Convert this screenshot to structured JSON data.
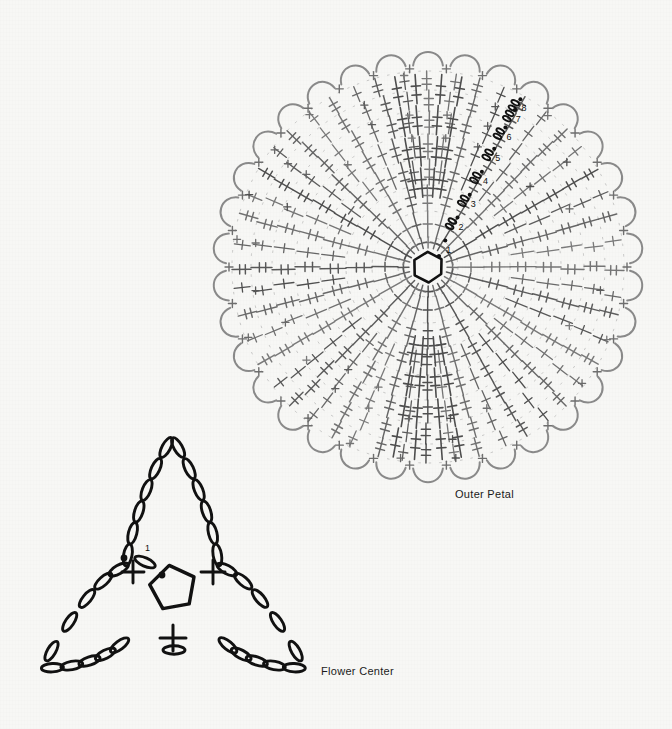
{
  "page": {
    "background_color": "#f7f7f5",
    "ink_dark": "#111111",
    "ink_gray": "#6e6e6e",
    "ink_mid": "#4a4a4a"
  },
  "diagram": {
    "type": "crochet-stitch-chart",
    "motifs": [
      {
        "id": "outer-petal",
        "caption": "Outer Petal",
        "caption_position": {
          "x": 455,
          "y": 488
        },
        "center": {
          "x": 428,
          "y": 267
        },
        "start": "magic-ring",
        "rounds": 8,
        "spokes": 24,
        "outer_radius": 215,
        "round_labels": [
          "1",
          "2",
          "3",
          "4",
          "5",
          "6",
          "7",
          "8"
        ],
        "round_label_radii": [
          22,
          48,
          74,
          100,
          126,
          150,
          170,
          182
        ],
        "round_label_angle_deg": -62,
        "edge_stitch": "chain-loop-arc",
        "symbols": [
          "magic-ring",
          "chain",
          "slip-stitch",
          "single-crochet",
          "double-crochet",
          "treble-crochet"
        ]
      },
      {
        "id": "flower-center",
        "caption": "Flower Center",
        "caption_position": {
          "x": 321,
          "y": 665
        },
        "center": {
          "x": 173,
          "y": 592
        },
        "start": "ring",
        "rounds": 1,
        "round_labels": [
          "1"
        ],
        "points": 3,
        "petal_tip_top": {
          "x": 172,
          "y": 437
        },
        "petal_tip_left": {
          "x": 42,
          "y": 668
        },
        "petal_tip_right": {
          "x": 305,
          "y": 668
        },
        "symbols": [
          "ring",
          "chain",
          "slip-stitch",
          "single-crochet"
        ]
      }
    ],
    "legend_visible": false
  }
}
